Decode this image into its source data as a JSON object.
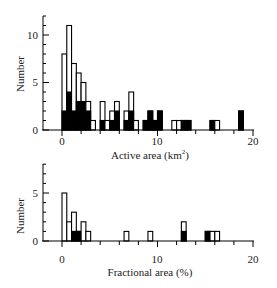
{
  "chart_data": [
    {
      "type": "bar",
      "subtype": "stacked-histogram",
      "title": "",
      "xlabel": "Active area (km²)",
      "xlabel_main": "Active area (km",
      "xlabel_sup": "2",
      "xlabel_end": ")",
      "ylabel": "Number",
      "xlim": [
        0,
        20
      ],
      "ylim": [
        0,
        12
      ],
      "xticks": [
        0,
        10,
        20
      ],
      "yticks": [
        0,
        5,
        10
      ],
      "grid": false,
      "legend": [],
      "bin_width": 0.5,
      "bins_start": [
        0,
        0.5,
        1,
        1.5,
        2,
        2.5,
        3,
        4,
        4.5,
        5,
        5.5,
        6.5,
        7,
        7.5,
        8.5,
        9,
        9.5,
        10,
        11.5,
        12,
        12.5,
        13,
        15.5,
        16,
        18.5
      ],
      "series": [
        {
          "name": "total (open)",
          "values": [
            8,
            11,
            7,
            6,
            5,
            3,
            1,
            3,
            1,
            2,
            3,
            2,
            4,
            1,
            1,
            2,
            1,
            2,
            1,
            1,
            1,
            1,
            1,
            1,
            2
          ]
        },
        {
          "name": "filled (black)",
          "values": [
            2,
            4,
            2,
            3,
            3,
            2,
            0,
            1,
            0,
            1,
            2,
            1,
            2,
            0,
            1,
            2,
            1,
            2,
            0,
            0,
            1,
            1,
            1,
            0,
            2
          ]
        }
      ]
    },
    {
      "type": "bar",
      "subtype": "stacked-histogram",
      "title": "",
      "xlabel": "Fractional area (%)",
      "ylabel": "Number",
      "xlim": [
        0,
        20
      ],
      "ylim": [
        0,
        8
      ],
      "xticks": [
        0,
        10,
        20
      ],
      "yticks": [
        0,
        5
      ],
      "grid": false,
      "legend": [],
      "bin_width": 0.5,
      "bins_start": [
        0,
        0.5,
        1,
        1.5,
        2,
        2.5,
        6.5,
        9,
        12.5,
        15,
        15.5,
        16
      ],
      "series": [
        {
          "name": "total (open)",
          "values": [
            5,
            2,
            3,
            1,
            2,
            1,
            1,
            1,
            2,
            1,
            1,
            1
          ]
        },
        {
          "name": "filled (black)",
          "values": [
            0,
            0,
            1,
            1,
            0,
            0,
            0,
            0,
            1,
            1,
            0,
            0
          ]
        }
      ]
    }
  ],
  "labels": {
    "top": {
      "ylabel": "Number",
      "xlabel_main": "Active area (km",
      "xlabel_sup": "2",
      "xlabel_end": ")",
      "xticks": [
        "0",
        "10",
        "20"
      ],
      "yticks": [
        "0",
        "5",
        "10"
      ]
    },
    "bottom": {
      "ylabel": "Number",
      "xlabel": "Fractional area (%)",
      "xticks": [
        "0",
        "10",
        "20"
      ],
      "yticks": [
        "0",
        "5"
      ]
    }
  },
  "colors": {
    "filled": "#000000",
    "open": "#ffffff",
    "stroke": "#000000"
  }
}
